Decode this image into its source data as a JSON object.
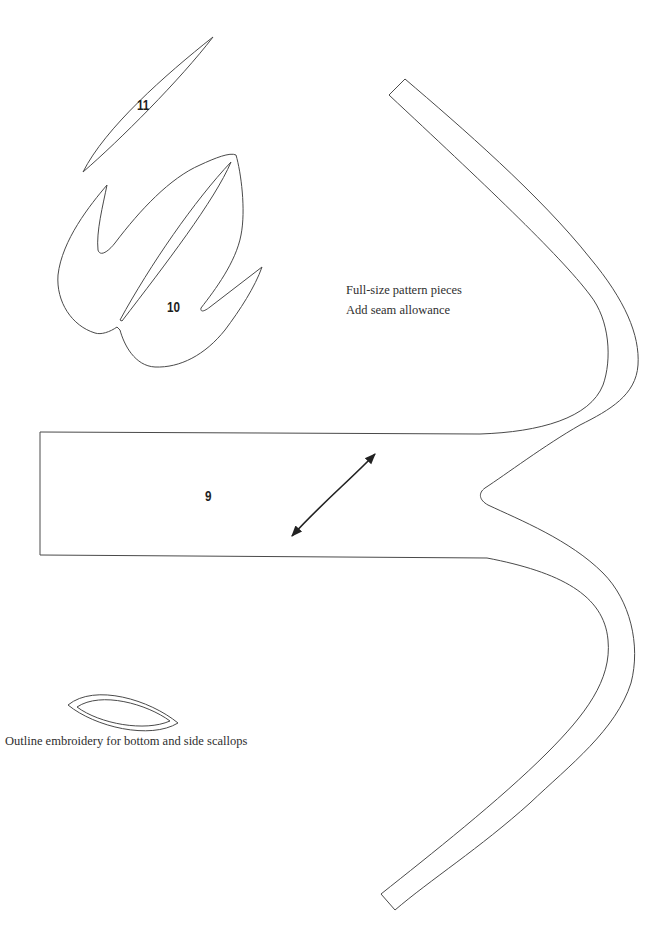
{
  "pieces": [
    {
      "id": "piece-11",
      "label": "11"
    },
    {
      "id": "piece-10",
      "label": "10"
    },
    {
      "id": "piece-9",
      "label": "9"
    }
  ],
  "notes": {
    "line1": "Full-size pattern pieces",
    "line2": "Add seam allowance"
  },
  "embroidery": {
    "caption": "Outline embroidery for bottom and side scallops"
  },
  "grainline": {
    "icon": "double-headed-arrow-icon"
  },
  "colors": {
    "background": "#ffffff",
    "outline": "#4a4a4a",
    "text": "#2e2e2e"
  }
}
